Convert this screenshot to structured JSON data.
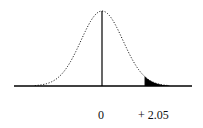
{
  "chart_data": {
    "type": "area",
    "title": "",
    "subtitle": "",
    "xlabel": "",
    "ylabel": "",
    "distribution": "standard normal",
    "x_ticks": [
      {
        "value": 0,
        "label": "0"
      },
      {
        "value": 2.05,
        "label": "+ 2.05"
      }
    ],
    "vertical_lines": [
      {
        "x": 0,
        "note": "mean / center line"
      },
      {
        "x": 2.05,
        "note": "critical value boundary"
      }
    ],
    "shaded_region": {
      "from": 2.05,
      "to": "infinity",
      "tail": "right",
      "color": "#000000"
    },
    "curve_style": "dotted",
    "grid": false,
    "legend": null,
    "xlim": [
      -3.2,
      3.2
    ]
  },
  "labels": {
    "zero": "0",
    "critical": "+ 2.05"
  },
  "colors": {
    "curve": "#222222",
    "shade": "#000000",
    "axis": "#000000"
  }
}
